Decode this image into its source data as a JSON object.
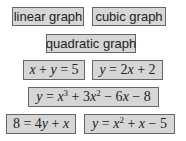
{
  "labels": [
    "linear graph",
    "cubic graph",
    "quadratic graph"
  ],
  "equations": [
    {
      "lhs": "x + y",
      "rhs": "5"
    },
    {
      "lhs": "y",
      "rhs": "2x + 2"
    },
    {
      "lhs": "y",
      "rhs": "x³ + 3x² − 6x − 8"
    },
    {
      "lhs": "8",
      "rhs": "4y + x"
    },
    {
      "lhs": "y",
      "rhs": "x² + x − 5"
    }
  ],
  "colors": {
    "card_bg": "#d6d6d6",
    "card_border": "#666666",
    "text": "#222222"
  }
}
